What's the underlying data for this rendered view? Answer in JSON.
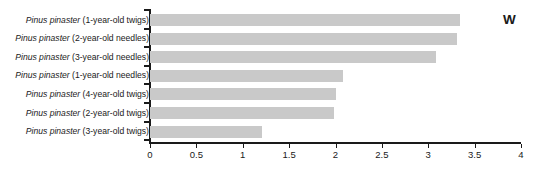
{
  "chart_data": {
    "type": "bar",
    "orientation": "horizontal",
    "title": "",
    "panel_label": "W",
    "xlabel": "",
    "ylabel": "",
    "xlim": [
      0,
      4
    ],
    "xticks": [
      "0",
      "0.5",
      "1",
      "1.5",
      "2",
      "2.5",
      "3",
      "3.5",
      "4"
    ],
    "xtick_values": [
      0,
      0.5,
      1,
      1.5,
      2,
      2.5,
      3,
      3.5,
      4
    ],
    "grid": false,
    "legend": "none",
    "bar_color": "#c9c9c9",
    "axis_color": "#1a1a1a",
    "categories": [
      "Pinus pinaster (1-year-old twigs)",
      "Pinus pinaster (2-year-old needles)",
      "Pinus pinaster (3-year-old needles)",
      "Pinus pinaster (1-year-old needles)",
      "Pinus pinaster (4-year-old twigs)",
      "Pinus pinaster (2-year-old twigs)",
      "Pinus pinaster (3-year-old twigs)"
    ],
    "category_parts": [
      {
        "genus": "Pinus pinaster",
        "rest": " (1-year-old twigs)"
      },
      {
        "genus": "Pinus pinaster",
        "rest": " (2-year-old needles)"
      },
      {
        "genus": "Pinus pinaster",
        "rest": " (3-year-old needles)"
      },
      {
        "genus": "Pinus pinaster",
        "rest": " (1-year-old needles)"
      },
      {
        "genus": "Pinus pinaster",
        "rest": " (4-year-old twigs)"
      },
      {
        "genus": "Pinus pinaster",
        "rest": " (2-year-old twigs)"
      },
      {
        "genus": "Pinus pinaster",
        "rest": " (3-year-old twigs)"
      }
    ],
    "values": [
      3.34,
      3.31,
      3.08,
      2.08,
      2.0,
      1.98,
      1.21
    ]
  }
}
